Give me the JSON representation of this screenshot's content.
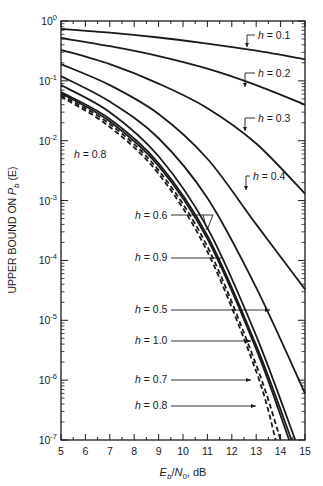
{
  "chart_data": {
    "type": "line",
    "title": "",
    "xlabel": "E_b/N_0, dB",
    "xlabel_parts": {
      "E": "E",
      "b": "b",
      "slash": "/",
      "N": "N",
      "zero": "0",
      "unit": ", dB"
    },
    "ylabel": "UPPER BOUND ON P_b (E)",
    "ylabel_parts": {
      "prefix": "UPPER BOUND ON ",
      "P": "P",
      "b": "b",
      "suffix": " (E)"
    },
    "xlim": [
      5,
      15
    ],
    "ylim": [
      1e-07,
      1
    ],
    "yscale": "log",
    "grid": false,
    "x_ticks": [
      5,
      6,
      7,
      8,
      9,
      10,
      11,
      12,
      13,
      14,
      15
    ],
    "x_tick_labels": [
      "5",
      "6",
      "7",
      "8",
      "9",
      "10",
      "11",
      "12",
      "13",
      "14",
      "15"
    ],
    "y_ticks": [
      0,
      -1,
      -2,
      -3,
      -4,
      -5,
      -6,
      -7
    ],
    "y_tick_labels": [
      {
        "base": "10",
        "exp": "0"
      },
      {
        "base": "10",
        "exp": "-1"
      },
      {
        "base": "10",
        "exp": "-2"
      },
      {
        "base": "10",
        "exp": "-3"
      },
      {
        "base": "10",
        "exp": "-4"
      },
      {
        "base": "10",
        "exp": "-5"
      },
      {
        "base": "10",
        "exp": "-6"
      },
      {
        "base": "10",
        "exp": "-7"
      }
    ],
    "series": [
      {
        "name": "h = 0.1",
        "style": "solid",
        "x": [
          5,
          7,
          9,
          11,
          13,
          15
        ],
        "y": [
          0.74,
          0.64,
          0.53,
          0.42,
          0.32,
          0.23
        ]
      },
      {
        "name": "h = 0.2",
        "style": "solid",
        "x": [
          5,
          7,
          9,
          11,
          13,
          15
        ],
        "y": [
          0.52,
          0.38,
          0.26,
          0.16,
          0.085,
          0.04
        ]
      },
      {
        "name": "h = 0.3",
        "style": "solid",
        "x": [
          5,
          7,
          9,
          11,
          13,
          15
        ],
        "y": [
          0.33,
          0.19,
          0.09,
          0.035,
          0.009,
          0.0013
        ]
      },
      {
        "name": "h = 0.4",
        "style": "solid",
        "x": [
          5,
          7,
          9,
          11,
          13,
          15
        ],
        "y": [
          0.19,
          0.085,
          0.028,
          0.005,
          0.0004,
          3.3e-05
        ]
      },
      {
        "name": "h = 0.5",
        "style": "solid",
        "x": [
          5,
          7,
          9,
          11,
          13,
          15
        ],
        "y": [
          0.12,
          0.045,
          0.011,
          0.0011,
          3.5e-05,
          6e-07
        ]
      },
      {
        "name": "h = 0.6",
        "style": "solid",
        "x": [
          5,
          7,
          9,
          11,
          13,
          14.6
        ],
        "y": [
          0.085,
          0.03,
          0.0055,
          0.00035,
          5.5e-06,
          1e-07
        ]
      },
      {
        "name": "h = 0.9",
        "style": "solid",
        "x": [
          5,
          7,
          9,
          11,
          13,
          14.45
        ],
        "y": [
          0.065,
          0.023,
          0.0042,
          0.00026,
          3.8e-06,
          1e-07
        ]
      },
      {
        "name": "h = 1.0",
        "style": "solid",
        "x": [
          5,
          7,
          9,
          11,
          13,
          14.35
        ],
        "y": [
          0.062,
          0.021,
          0.0038,
          0.00023,
          3.3e-06,
          1e-07
        ]
      },
      {
        "name": "h = 0.7",
        "style": "dashed",
        "x": [
          5,
          7,
          9,
          11,
          13,
          14.0
        ],
        "y": [
          0.058,
          0.019,
          0.0032,
          0.00017,
          1.8e-06,
          1e-07
        ]
      },
      {
        "name": "h = 0.8",
        "style": "dashed",
        "x": [
          5,
          7,
          9,
          11,
          13,
          13.8
        ],
        "y": [
          0.055,
          0.017,
          0.0028,
          0.00014,
          1.4e-06,
          1e-07
        ]
      }
    ],
    "annotations": [
      {
        "text": "h = 0.1",
        "h": "h",
        "val": " = 0.1"
      },
      {
        "text": "h = 0.2",
        "h": "h",
        "val": " = 0.2"
      },
      {
        "text": "h = 0.3",
        "h": "h",
        "val": " = 0.3"
      },
      {
        "text": "h = 0.4",
        "h": "h",
        "val": " = 0.4"
      },
      {
        "text": "h = 0.8",
        "h": "h",
        "val": " = 0.8"
      },
      {
        "text": "h = 0.6",
        "h": "h",
        "val": " = 0.6"
      },
      {
        "text": "h = 0.9",
        "h": "h",
        "val": " = 0.9"
      },
      {
        "text": "h = 0.5",
        "h": "h",
        "val": " = 0.5"
      },
      {
        "text": "h = 1.0",
        "h": "h",
        "val": " = 1.0"
      },
      {
        "text": "h = 0.7",
        "h": "h",
        "val": " = 0.7"
      },
      {
        "text": "h = 0.8",
        "h": "h",
        "val": " = 0.8"
      }
    ],
    "legend": "none (curves labeled by inline annotations)"
  }
}
